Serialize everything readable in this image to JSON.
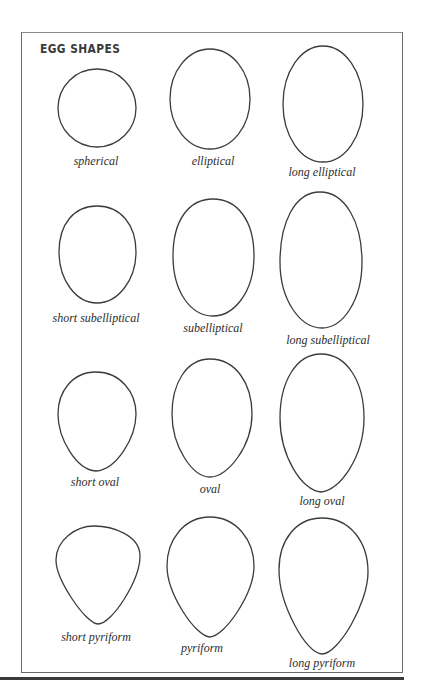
{
  "title": "EGG SHAPES",
  "rows": [
    {
      "row_name": "elliptical",
      "shapes": [
        {
          "label": "spherical"
        },
        {
          "label": "elliptical"
        },
        {
          "label": "long elliptical"
        }
      ]
    },
    {
      "row_name": "subelliptical",
      "shapes": [
        {
          "label": "short subelliptical"
        },
        {
          "label": "subelliptical"
        },
        {
          "label": "long subelliptical"
        }
      ]
    },
    {
      "row_name": "oval",
      "shapes": [
        {
          "label": "short oval"
        },
        {
          "label": "oval"
        },
        {
          "label": "long oval"
        }
      ]
    },
    {
      "row_name": "pyriform",
      "shapes": [
        {
          "label": "short pyriform"
        },
        {
          "label": "pyriform"
        },
        {
          "label": "long pyriform"
        }
      ]
    }
  ],
  "colors": {
    "outline": "#3c3c3c",
    "frame": "#6a6a6a",
    "text": "#2e2e2e"
  }
}
